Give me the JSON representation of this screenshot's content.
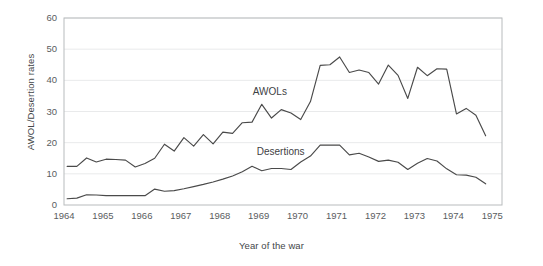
{
  "chart_data": {
    "type": "line",
    "title": "",
    "xlabel": "Year of the war",
    "ylabel": "AWOL/Desertion rates",
    "xlim": [
      1964,
      1975.25
    ],
    "ylim": [
      0,
      60
    ],
    "grid": true,
    "legend_position": "inline-annotations",
    "x_tick_labels": [
      "1964",
      "1965",
      "1966",
      "1967",
      "1968",
      "1969",
      "1970",
      "1971",
      "1972",
      "1973",
      "1974",
      "1975"
    ],
    "x_tick_values": [
      1964,
      1965,
      1966,
      1967,
      1968,
      1969,
      1970,
      1971,
      1972,
      1973,
      1974,
      1975
    ],
    "y_tick_labels": [
      "0",
      "10",
      "20",
      "30",
      "40",
      "50",
      "60"
    ],
    "y_tick_values": [
      0,
      10,
      20,
      30,
      40,
      50,
      60
    ],
    "series": [
      {
        "name": "AWOLs",
        "color": "#4a4a4a",
        "label_x": 1968.85,
        "label_y": 36.0,
        "x": [
          1964.08,
          1964.33,
          1964.58,
          1964.83,
          1965.08,
          1965.33,
          1965.58,
          1965.83,
          1966.08,
          1966.33,
          1966.58,
          1966.83,
          1967.08,
          1967.33,
          1967.58,
          1967.83,
          1968.08,
          1968.33,
          1968.58,
          1968.83,
          1969.08,
          1969.33,
          1969.58,
          1969.83,
          1970.08,
          1970.33,
          1970.58,
          1970.83,
          1971.08,
          1971.33,
          1971.58,
          1971.83,
          1972.08,
          1972.33,
          1972.58,
          1972.83,
          1973.08,
          1973.33,
          1973.58,
          1973.83,
          1974.08,
          1974.33,
          1974.58,
          1974.83
        ],
        "y": [
          12.4,
          12.4,
          15.1,
          13.8,
          14.7,
          14.6,
          14.4,
          12.2,
          13.3,
          15.0,
          19.5,
          17.3,
          21.6,
          18.9,
          22.6,
          19.6,
          23.4,
          23.0,
          26.4,
          26.6,
          32.3,
          27.9,
          30.6,
          29.5,
          27.4,
          33.2,
          44.8,
          45.0,
          47.5,
          42.5,
          43.3,
          42.5,
          38.8,
          44.9,
          41.6,
          34.2,
          44.2,
          41.5,
          43.7,
          43.6,
          29.2,
          31.0,
          28.8,
          22.2
        ]
      },
      {
        "name": "Desertions",
        "color": "#4a4a4a",
        "label_x": 1968.95,
        "label_y": 16.6,
        "x": [
          1964.08,
          1964.33,
          1964.58,
          1964.83,
          1965.08,
          1965.33,
          1965.58,
          1965.83,
          1966.08,
          1966.33,
          1966.58,
          1966.83,
          1967.08,
          1967.33,
          1967.58,
          1967.83,
          1968.08,
          1968.33,
          1968.58,
          1968.83,
          1969.08,
          1969.33,
          1969.58,
          1969.83,
          1970.08,
          1970.33,
          1970.58,
          1970.83,
          1971.08,
          1971.33,
          1971.58,
          1971.83,
          1972.08,
          1972.33,
          1972.58,
          1972.83,
          1973.08,
          1973.33,
          1973.58,
          1973.83,
          1974.08,
          1974.33,
          1974.58,
          1974.83
        ],
        "y": [
          2.0,
          2.2,
          3.3,
          3.2,
          3.0,
          3.0,
          3.0,
          3.0,
          3.0,
          5.1,
          4.4,
          4.6,
          5.2,
          5.9,
          6.6,
          7.4,
          8.3,
          9.3,
          10.7,
          12.4,
          11.0,
          11.7,
          11.7,
          11.4,
          13.8,
          15.7,
          19.2,
          19.2,
          19.2,
          16.1,
          16.6,
          15.4,
          14.0,
          14.4,
          13.7,
          11.4,
          13.4,
          14.9,
          14.1,
          11.6,
          9.7,
          9.6,
          8.9,
          6.8
        ]
      }
    ]
  }
}
